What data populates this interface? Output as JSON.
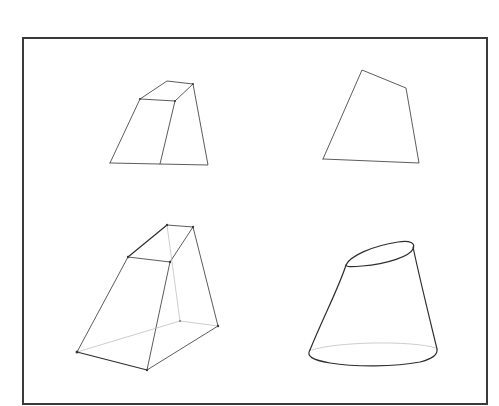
{
  "figure": {
    "background": "#ffffff",
    "frame": {
      "x": 23,
      "y": 38,
      "width": 464,
      "height": 366,
      "color": "#3a3a3a"
    },
    "stroke_color": "#4a4a4a",
    "shapes": [
      {
        "id": "truncated-wedge-top-left",
        "description": "Truncated wedge / frustum sketch with visible top face",
        "outline": [
          [
            110,
            163
          ],
          [
            140,
            99
          ],
          [
            167,
            81
          ],
          [
            193,
            84
          ],
          [
            208,
            165
          ],
          [
            110,
            163
          ]
        ],
        "edges": [
          [
            [
              140,
              99
            ],
            [
              175,
              101
            ]
          ],
          [
            [
              175,
              101
            ],
            [
              193,
              84
            ]
          ],
          [
            [
              175,
              101
            ],
            [
              160,
              164
            ]
          ]
        ]
      },
      {
        "id": "quadrilateral-top-right",
        "description": "Flat quadrilateral silhouette",
        "outline": [
          [
            323,
            159
          ],
          [
            362,
            70
          ],
          [
            406,
            88
          ],
          [
            419,
            163
          ],
          [
            323,
            159
          ]
        ]
      },
      {
        "id": "wireframe-frustum-bottom-left",
        "description": "Wireframe truncated prism with hidden edges",
        "vertices": {
          "top_front_left": [
            128,
            257
          ],
          "top_front_right": [
            170,
            262
          ],
          "top_back_left": [
            167,
            225
          ],
          "top_back_right": [
            193,
            227
          ],
          "bottom_left": [
            77,
            352
          ],
          "bottom_front": [
            147,
            370
          ],
          "bottom_right": [
            218,
            326
          ],
          "bottom_hidden": [
            180,
            321
          ]
        }
      },
      {
        "id": "truncated-cone-bottom-right",
        "description": "Slanted truncated cone with elliptical top",
        "top_ellipse": {
          "cx": 380,
          "cy": 254,
          "rx": 35,
          "ry": 11,
          "rotate": -18
        },
        "bottom": {
          "left": [
            310,
            355
          ],
          "right": [
            437,
            350
          ],
          "low": [
            370,
            366
          ]
        }
      }
    ]
  }
}
